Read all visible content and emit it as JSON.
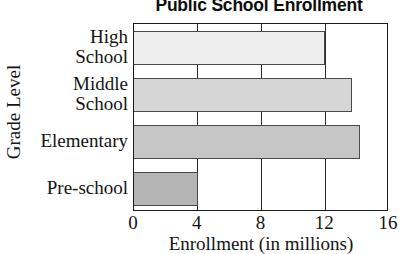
{
  "chart_data": {
    "type": "bar",
    "orientation": "horizontal",
    "title": "Public School Enrollment",
    "xlabel": "Enrollment (in millions)",
    "ylabel": "Grade Level",
    "categories": [
      "High School",
      "Middle School",
      "Elementary",
      "Pre-school"
    ],
    "category_lines": [
      [
        "High",
        "School"
      ],
      [
        "Middle",
        "School"
      ],
      [
        "Elementary"
      ],
      [
        "Pre-school"
      ]
    ],
    "values": [
      12,
      13.7,
      14.2,
      4
    ],
    "xlim": [
      0,
      16
    ],
    "xticks": [
      0,
      4,
      8,
      12,
      16
    ],
    "xtick_labels": [
      "0",
      "4",
      "8",
      "12",
      "16"
    ],
    "grid": "vertical",
    "legend": "none",
    "bar_colors": [
      "#eeeeee",
      "#d6d6d6",
      "#c6c6c6",
      "#b4b4b4"
    ],
    "bar_edge_color": "#4a4a4a",
    "axis_color": "#1b1b1b"
  }
}
